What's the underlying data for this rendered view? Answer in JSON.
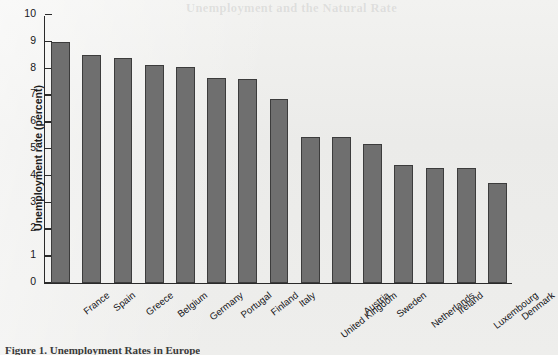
{
  "page": {
    "ghost_header_text": "Unemployment and the Natural Rate",
    "caption": "Figure 1. Unemployment Rates in Europe"
  },
  "chart_data": {
    "type": "bar",
    "title": "",
    "xlabel": "",
    "ylabel": "Unemployment rate (percent)",
    "ylim": [
      0,
      10
    ],
    "ytick_labels": [
      "10",
      "9",
      "8",
      "7",
      "6",
      "5",
      "4",
      "3",
      "2",
      "1",
      "0"
    ],
    "yticks": [
      10,
      9,
      8,
      7,
      6,
      5,
      4,
      3,
      2,
      1,
      0
    ],
    "grid": false,
    "legend": null,
    "bar_color": "#6f6f6f",
    "bar_edge_color": "#3c3c3c",
    "categories": [
      "France",
      "Spain",
      "Greece",
      "Belgium",
      "Germany",
      "Portugal",
      "Finland",
      "Italy",
      "United Kingdom",
      "Austria",
      "Sweden",
      "Netherlands",
      "Ireland",
      "Luxembourg",
      "Denmark"
    ],
    "values": [
      9.0,
      8.5,
      8.4,
      8.15,
      8.05,
      7.65,
      7.6,
      6.85,
      5.45,
      5.45,
      5.2,
      4.4,
      4.3,
      4.3,
      3.75
    ]
  }
}
